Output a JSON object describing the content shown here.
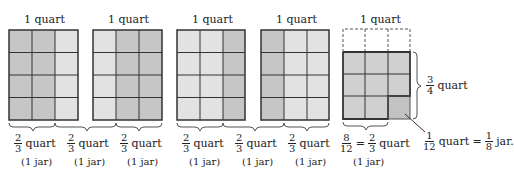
{
  "colors": {
    "dark_fill": "#c4c4c4",
    "light_fill": "#e0e0e0",
    "line": "#333333"
  },
  "quart_label": "1 quart",
  "jar_fraction": {
    "num": "2",
    "den": "3",
    "unit": "quart"
  },
  "jar_label": "(1 jar)",
  "quarts": [
    {
      "label": "1 quart",
      "dark_cols": [
        0,
        1
      ]
    },
    {
      "label": "1 quart",
      "dark_cols": [
        1,
        2
      ]
    },
    {
      "label": "1 quart",
      "dark_cols": [
        2
      ]
    },
    {
      "label": "1 quart",
      "dark_cols": [
        0
      ]
    }
  ],
  "groups": [
    {
      "num": "2",
      "den": "3",
      "unit": "quart",
      "jar": "(1 jar)"
    },
    {
      "num": "2",
      "den": "3",
      "unit": "quart",
      "jar": "(1 jar)"
    },
    {
      "num": "2",
      "den": "3",
      "unit": "quart",
      "jar": "(1 jar)"
    },
    {
      "num": "2",
      "den": "3",
      "unit": "quart",
      "jar": "(1 jar)"
    },
    {
      "num": "2",
      "den": "3",
      "unit": "quart",
      "jar": "(1 jar)"
    },
    {
      "num": "2",
      "den": "3",
      "unit": "quart",
      "jar": "(1 jar)"
    }
  ],
  "last": {
    "label": "1 quart",
    "side_num": "3",
    "side_den": "4",
    "side_unit": "quart",
    "eq_num1": "8",
    "eq_den1": "12",
    "eq_equals": "=",
    "eq_num2": "2",
    "eq_den2": "3",
    "eq_unit": "quart",
    "eq_jar": "(1 jar)",
    "piece_num": "1",
    "piece_den": "12",
    "piece_unit": "quart =",
    "jar_num": "1",
    "jar_den": "8",
    "jar_unit": "jar."
  }
}
